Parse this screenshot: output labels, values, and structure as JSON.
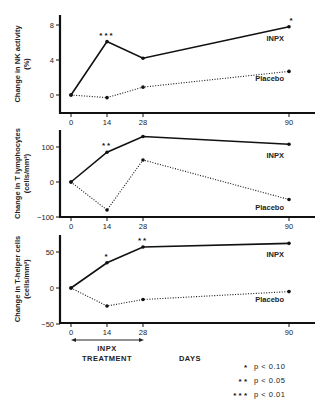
{
  "chart_data": [
    {
      "type": "line",
      "ylabel_lines": [
        "Change in NK activity",
        "(%)"
      ],
      "xlabel": "DAYS",
      "x": [
        0,
        14,
        28,
        90
      ],
      "x_ticks": [
        "0",
        "14",
        "28",
        "90"
      ],
      "y_ticks": [
        0,
        4,
        8
      ],
      "ylim": [
        -2,
        9.5
      ],
      "series": [
        {
          "name": "INPX",
          "style": "solid",
          "values": [
            0,
            6.1,
            4.2,
            7.8
          ],
          "significance": [
            "",
            "***",
            "",
            "*"
          ]
        },
        {
          "name": "Placebo",
          "style": "dotted",
          "values": [
            0,
            -0.3,
            0.9,
            2.7
          ],
          "significance": [
            "",
            "",
            "",
            ""
          ]
        }
      ]
    },
    {
      "type": "line",
      "ylabel_lines": [
        "Change in T lymphocytes",
        "(cells/mm³)"
      ],
      "xlabel": "DAYS",
      "x": [
        0,
        14,
        28,
        90
      ],
      "x_ticks": [
        "0",
        "14",
        "28",
        "90"
      ],
      "y_ticks": [
        -100,
        0,
        100
      ],
      "ylim": [
        -100,
        150
      ],
      "series": [
        {
          "name": "INPX",
          "style": "solid",
          "values": [
            0,
            85,
            130,
            108
          ],
          "significance": [
            "",
            "**",
            "",
            ""
          ]
        },
        {
          "name": "Placebo",
          "style": "dotted",
          "values": [
            0,
            -80,
            63,
            -50
          ],
          "significance": [
            "",
            "",
            "",
            ""
          ]
        }
      ]
    },
    {
      "type": "line",
      "ylabel_lines": [
        "Change in T-helper cells",
        "(cells/mm³)"
      ],
      "xlabel": "DAYS",
      "x": [
        0,
        14,
        28,
        90
      ],
      "x_ticks": [
        "0",
        "14",
        "28",
        "90"
      ],
      "y_ticks": [
        -50,
        0,
        50
      ],
      "ylim": [
        -50,
        75
      ],
      "series": [
        {
          "name": "INPX",
          "style": "solid",
          "values": [
            0,
            35,
            57,
            62
          ],
          "significance": [
            "",
            "*",
            "**",
            ""
          ]
        },
        {
          "name": "Placebo",
          "style": "dotted",
          "values": [
            0,
            -25,
            -16,
            -5
          ],
          "significance": [
            "",
            "",
            "",
            ""
          ]
        }
      ]
    }
  ],
  "annotations": {
    "treatment_line1": "INPX",
    "treatment_line2": "TREATMENT",
    "xlabel": "DAYS"
  },
  "legend": [
    {
      "marker": "*",
      "text": "p < 0.10"
    },
    {
      "marker": "* *",
      "text": "p < 0.05"
    },
    {
      "marker": "* * *",
      "text": "p < 0.01"
    }
  ]
}
